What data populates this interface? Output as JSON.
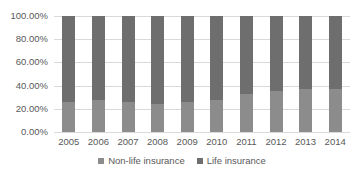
{
  "chart_data": {
    "type": "bar",
    "stacked": true,
    "percent_stacked": true,
    "title": "",
    "xlabel": "",
    "ylabel": "",
    "ylim": [
      0,
      100
    ],
    "yticks": [
      "0.00%",
      "20.00%",
      "40.00%",
      "60.00%",
      "80.00%",
      "100.00%"
    ],
    "categories": [
      "2005",
      "2006",
      "2007",
      "2008",
      "2009",
      "2010",
      "2011",
      "2012",
      "2013",
      "2014"
    ],
    "series": [
      {
        "name": "Non-life insurance",
        "color": "#8c8c8c",
        "values": [
          26,
          27.6,
          26,
          24,
          26,
          27.6,
          32.8,
          35,
          37,
          37
        ]
      },
      {
        "name": "Life insurance",
        "color": "#6e6e6e",
        "values": [
          74,
          72.4,
          74,
          76,
          74,
          72.4,
          67.2,
          65,
          63,
          63
        ]
      }
    ],
    "grid": true,
    "legend_position": "bottom"
  },
  "legend": {
    "items": [
      {
        "label": "Non-life insurance",
        "color": "#8c8c8c"
      },
      {
        "label": "Life insurance",
        "color": "#6e6e6e"
      }
    ]
  }
}
